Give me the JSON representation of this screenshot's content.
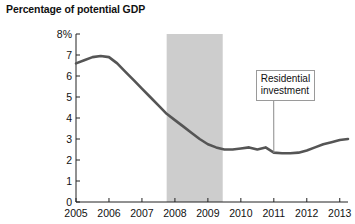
{
  "chart_data": {
    "type": "line",
    "title": "Percentage of potential GDP",
    "xlabel": "",
    "ylabel": "Percentage of potential GDP",
    "xlim": [
      2005,
      2013.25
    ],
    "ylim": [
      0,
      8
    ],
    "grid": false,
    "legend_position": "annotation",
    "y_ticks": [
      0,
      1,
      2,
      3,
      4,
      5,
      6,
      7,
      8
    ],
    "y_tick_labels": [
      "0",
      "1",
      "2",
      "3",
      "4",
      "5",
      "6",
      "7",
      "8%"
    ],
    "x_ticks": [
      2005,
      2006,
      2007,
      2008,
      2009,
      2010,
      2011,
      2012,
      2013
    ],
    "x_tick_labels": [
      "2005",
      "2006",
      "2007",
      "2008",
      "2009",
      "2010",
      "2011",
      "2012",
      "2013"
    ],
    "series": [
      {
        "name": "Residential investment",
        "color": "#555555",
        "x": [
          2005.0,
          2005.25,
          2005.5,
          2005.75,
          2006.0,
          2006.25,
          2006.5,
          2006.75,
          2007.0,
          2007.25,
          2007.5,
          2007.75,
          2008.0,
          2008.25,
          2008.5,
          2008.75,
          2009.0,
          2009.25,
          2009.5,
          2009.75,
          2010.0,
          2010.25,
          2010.5,
          2010.75,
          2011.0,
          2011.25,
          2011.5,
          2011.75,
          2012.0,
          2012.25,
          2012.5,
          2012.75,
          2013.0,
          2013.25
        ],
        "values": [
          6.6,
          6.75,
          6.9,
          6.95,
          6.9,
          6.6,
          6.2,
          5.8,
          5.4,
          5.0,
          4.6,
          4.2,
          3.9,
          3.6,
          3.3,
          3.0,
          2.75,
          2.6,
          2.5,
          2.5,
          2.55,
          2.6,
          2.5,
          2.6,
          2.35,
          2.32,
          2.32,
          2.35,
          2.45,
          2.6,
          2.75,
          2.85,
          2.95,
          3.0
        ]
      }
    ],
    "shaded_regions": [
      {
        "name": "recession-band",
        "x_start": 2007.75,
        "x_end": 2009.45,
        "color": "#cdcdcd"
      }
    ],
    "annotations": [
      {
        "name": "residential-investment-callout",
        "text": "Residential\ninvestment",
        "box_x": 2010.45,
        "box_y": 6.3,
        "point_x": 2011.0,
        "point_y": 2.33
      }
    ]
  }
}
